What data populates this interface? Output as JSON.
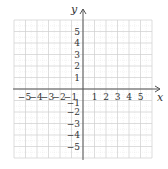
{
  "diagram": {
    "type": "coordinate-plane",
    "x_axis": {
      "label": "x",
      "ticks": [
        "-5",
        "-4",
        "-3",
        "-2",
        "-1",
        "1",
        "2",
        "3",
        "4",
        "5"
      ]
    },
    "y_axis": {
      "label": "y",
      "ticks": [
        "5",
        "4",
        "3",
        "2",
        "1",
        "-1",
        "-2",
        "-3",
        "-4",
        "-5"
      ]
    },
    "grid": {
      "x_range": [
        -6,
        6
      ],
      "y_range": [
        -6,
        6
      ],
      "color": "#cfcfcf"
    },
    "axis_color": "#555555"
  }
}
